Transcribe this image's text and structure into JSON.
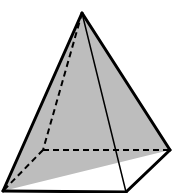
{
  "diagram": {
    "type": "square-pyramid",
    "colors": {
      "stroke": "#000000",
      "shade": "#bdbdbd",
      "background": "#ffffff"
    },
    "vertices": {
      "apex": [
        82,
        13
      ],
      "front_left": [
        3,
        191
      ],
      "front_right": [
        126,
        192
      ],
      "back_right": [
        170,
        150
      ],
      "back_left": [
        43,
        150
      ]
    },
    "shaded_triangle": [
      "apex",
      "front_left",
      "back_right"
    ],
    "solid_edges": [
      [
        "apex",
        "front_left"
      ],
      [
        "apex",
        "back_right"
      ],
      [
        "apex",
        "front_right"
      ],
      [
        "front_left",
        "front_right"
      ],
      [
        "front_right",
        "back_right"
      ]
    ],
    "dashed_edges": [
      [
        "apex",
        "back_left"
      ],
      [
        "back_left",
        "back_right"
      ],
      [
        "back_left",
        "front_left"
      ]
    ]
  }
}
